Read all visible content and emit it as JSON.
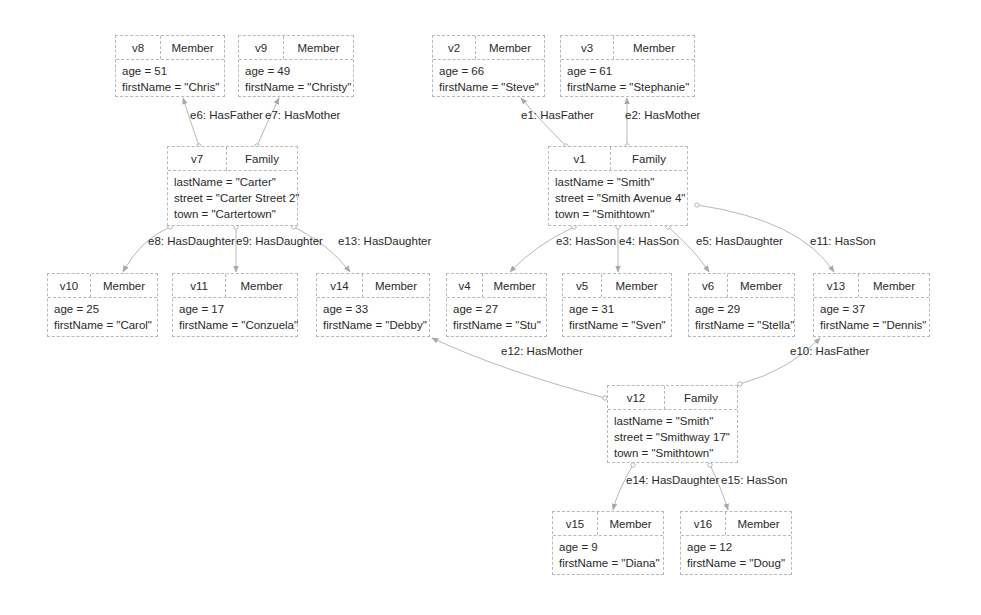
{
  "diagram": {
    "type": "property-graph",
    "nodes": [
      {
        "id": "v8",
        "type": "Member",
        "x": 115,
        "y": 35,
        "w": 110,
        "h": 62,
        "div": 45,
        "props": [
          "age = 51",
          "firstName = \"Chris\""
        ]
      },
      {
        "id": "v9",
        "type": "Member",
        "x": 238,
        "y": 35,
        "w": 116,
        "h": 62,
        "div": 45,
        "props": [
          "age = 49",
          "firstName = \"Christy\""
        ]
      },
      {
        "id": "v2",
        "type": "Member",
        "x": 432,
        "y": 35,
        "w": 113,
        "h": 62,
        "div": 43,
        "props": [
          "age = 66",
          "firstName = \"Steve\""
        ]
      },
      {
        "id": "v3",
        "type": "Member",
        "x": 560,
        "y": 35,
        "w": 135,
        "h": 62,
        "div": 53,
        "props": [
          "age = 61",
          "firstName = \"Stephanie\""
        ]
      },
      {
        "id": "v7",
        "type": "Family",
        "x": 167,
        "y": 146,
        "w": 131,
        "h": 80,
        "div": 59,
        "props": [
          "lastName = \"Carter\"",
          "street = \"Carter Street 2\"",
          "town = \"Cartertown\""
        ]
      },
      {
        "id": "v1",
        "type": "Family",
        "x": 548,
        "y": 146,
        "w": 140,
        "h": 80,
        "div": 62,
        "props": [
          "lastName = \"Smith\"",
          "street = \"Smith Avenue 4\"",
          "town = \"Smithtown\""
        ]
      },
      {
        "id": "v10",
        "type": "Member",
        "x": 47,
        "y": 273,
        "w": 111,
        "h": 64,
        "div": 43,
        "props": [
          "age = 25",
          "firstName = \"Carol\""
        ]
      },
      {
        "id": "v11",
        "type": "Member",
        "x": 172,
        "y": 273,
        "w": 126,
        "h": 64,
        "div": 53,
        "props": [
          "age = 17",
          "firstName = \"Conzuela\""
        ]
      },
      {
        "id": "v14",
        "type": "Member",
        "x": 316,
        "y": 273,
        "w": 114,
        "h": 64,
        "div": 46,
        "props": [
          "age = 33",
          "firstName = \"Debby\""
        ]
      },
      {
        "id": "v4",
        "type": "Member",
        "x": 446,
        "y": 273,
        "w": 101,
        "h": 64,
        "div": 36,
        "props": [
          "age = 27",
          "firstName = \"Stu\""
        ]
      },
      {
        "id": "v5",
        "type": "Member",
        "x": 562,
        "y": 273,
        "w": 110,
        "h": 64,
        "div": 39,
        "props": [
          "age = 31",
          "firstName = \"Sven\""
        ]
      },
      {
        "id": "v6",
        "type": "Member",
        "x": 688,
        "y": 273,
        "w": 107,
        "h": 64,
        "div": 39,
        "props": [
          "age = 29",
          "firstName = \"Stella\""
        ]
      },
      {
        "id": "v13",
        "type": "Member",
        "x": 813,
        "y": 273,
        "w": 117,
        "h": 64,
        "div": 45,
        "props": [
          "age = 37",
          "firstName = \"Dennis\""
        ]
      },
      {
        "id": "v12",
        "type": "Family",
        "x": 607,
        "y": 385,
        "w": 131,
        "h": 78,
        "div": 57,
        "props": [
          "lastName = \"Smith\"",
          "street = \"Smithway 17\"",
          "town = \"Smithtown\""
        ]
      },
      {
        "id": "v15",
        "type": "Member",
        "x": 552,
        "y": 511,
        "w": 112,
        "h": 64,
        "div": 45,
        "props": [
          "age = 9",
          "firstName = \"Diana\""
        ]
      },
      {
        "id": "v16",
        "type": "Member",
        "x": 680,
        "y": 511,
        "w": 112,
        "h": 64,
        "div": 45,
        "props": [
          "age = 12",
          "firstName = \"Doug\""
        ]
      }
    ],
    "edges": [
      {
        "id": "e1",
        "label": "e1: HasFather",
        "from": "v1",
        "to": "v2",
        "path": "M566,146 Q540,120 521,98",
        "lx": 521,
        "ly": 116
      },
      {
        "id": "e2",
        "label": "e2: HasMother",
        "from": "v1",
        "to": "v3",
        "path": "M627,146 L627,98",
        "lx": 625,
        "ly": 116
      },
      {
        "id": "e3",
        "label": "e3: HasSon",
        "from": "v1",
        "to": "v4",
        "path": "M574,227 Q535,245 510,272",
        "lx": 556,
        "ly": 242
      },
      {
        "id": "e4",
        "label": "e4: HasSon",
        "from": "v1",
        "to": "v5",
        "path": "M618,227 L618,272",
        "lx": 619,
        "ly": 242
      },
      {
        "id": "e5",
        "label": "e5: HasDaughter",
        "from": "v1",
        "to": "v6",
        "path": "M668,227 Q695,250 709,272",
        "lx": 696,
        "ly": 242
      },
      {
        "id": "e11",
        "label": "e11: HasSon",
        "from": "v1",
        "to": "v13",
        "path": "M697,205 Q800,220 834,272",
        "lx": 810,
        "ly": 242
      },
      {
        "id": "e6",
        "label": "e6: HasFather",
        "from": "v7",
        "to": "v8",
        "path": "M199,146 Q190,120 183,98",
        "lx": 190,
        "ly": 116
      },
      {
        "id": "e7",
        "label": "e7: HasMother",
        "from": "v7",
        "to": "v9",
        "path": "M257,146 Q268,120 279,98",
        "lx": 265,
        "ly": 116
      },
      {
        "id": "e8",
        "label": "e8: HasDaughter",
        "from": "v7",
        "to": "v10",
        "path": "M170,227 Q140,240 123,272",
        "lx": 148,
        "ly": 242
      },
      {
        "id": "e9",
        "label": "e9: HasDaughter",
        "from": "v7",
        "to": "v11",
        "path": "M236,227 L236,272",
        "lx": 236,
        "ly": 242
      },
      {
        "id": "e13",
        "label": "e13: HasDaughter",
        "from": "v7",
        "to": "v14",
        "path": "M294,227 Q330,245 350,272",
        "lx": 338,
        "ly": 242
      },
      {
        "id": "e12",
        "label": "e12: HasMother",
        "from": "v12",
        "to": "v14",
        "path": "M605,398 Q500,370 432,338",
        "lx": 501,
        "ly": 352
      },
      {
        "id": "e10",
        "label": "e10: HasFather",
        "from": "v12",
        "to": "v13",
        "path": "M740,384 Q790,370 820,338",
        "lx": 790,
        "ly": 352
      },
      {
        "id": "e14",
        "label": "e14: HasDaughter",
        "from": "v12",
        "to": "v15",
        "path": "M633,465 Q618,490 613,510",
        "lx": 626,
        "ly": 481
      },
      {
        "id": "e15",
        "label": "e15: HasSon",
        "from": "v12",
        "to": "v16",
        "path": "M710,465 Q722,490 728,510",
        "lx": 721,
        "ly": 481
      }
    ],
    "colors": {
      "node_border": "#b9b9b9",
      "edge": "#b8b8b8",
      "text": "#2a2a2a",
      "background": "#ffffff"
    }
  }
}
